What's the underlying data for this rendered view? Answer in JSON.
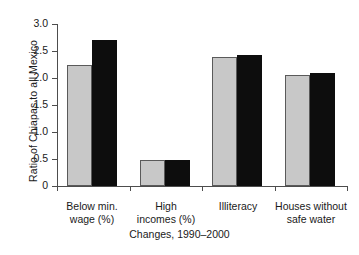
{
  "chart_data": {
    "type": "bar",
    "title": "",
    "xlabel": "Changes, 1990–2000",
    "ylabel": "Ratio of Chiapas to all Mexico",
    "categories": [
      "Below min. wage (%)",
      "High incomes (%)",
      "Illiteracy",
      "Houses without safe water"
    ],
    "category_lines": [
      [
        "Below min.",
        "wage (%)"
      ],
      [
        "High",
        "incomes (%)"
      ],
      [
        "Illiteracy",
        ""
      ],
      [
        "Houses without",
        "safe water"
      ]
    ],
    "series": [
      {
        "name": "1990",
        "color": "#c8c8c8",
        "values": [
          2.24,
          0.49,
          2.39,
          2.06
        ]
      },
      {
        "name": "2000",
        "color": "#0d0d0d",
        "values": [
          2.7,
          0.49,
          2.43,
          2.1
        ]
      }
    ],
    "ylim": [
      0,
      3.0
    ],
    "yticks": [
      0,
      0.5,
      1.0,
      1.5,
      2.0,
      2.5,
      3.0
    ],
    "ytick_labels": [
      "0",
      "0.5",
      "1.0",
      "1.5",
      "2.0",
      "2.5",
      "3.0"
    ],
    "grid": false,
    "legend": "none"
  }
}
